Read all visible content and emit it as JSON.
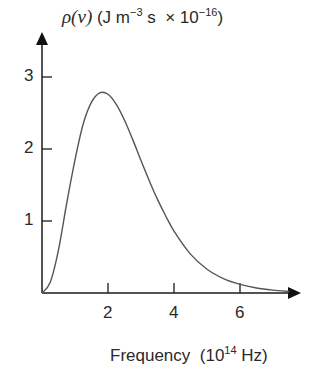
{
  "chart_data": {
    "type": "line",
    "title": "",
    "ylabel": {
      "symbol": "ρ(ν)",
      "units_prefix": "(J m",
      "units_exp": "−3",
      "units_mid": " s  × 10",
      "units_scale_exp": "−16",
      "units_suffix": ")"
    },
    "xlabel": {
      "text": "Frequency  (10",
      "exp": "14",
      "suffix": " Hz)"
    },
    "x_ticks": [
      "2",
      "4",
      "6"
    ],
    "y_ticks": [
      "1",
      "2",
      "3"
    ],
    "xlim": [
      0,
      7.7
    ],
    "ylim": [
      0,
      3.3
    ],
    "grid": false,
    "legend": null,
    "series": [
      {
        "name": "ρ(ν)",
        "x": [
          0,
          0.25,
          0.5,
          0.75,
          1.0,
          1.25,
          1.5,
          1.75,
          2.0,
          2.25,
          2.5,
          2.75,
          3.0,
          3.25,
          3.5,
          3.75,
          4.0,
          4.5,
          5.0,
          5.5,
          6.0,
          6.5,
          7.0,
          7.5
        ],
        "values": [
          0,
          0.15,
          0.6,
          1.25,
          1.85,
          2.35,
          2.65,
          2.78,
          2.76,
          2.62,
          2.4,
          2.13,
          1.84,
          1.56,
          1.3,
          1.07,
          0.86,
          0.54,
          0.33,
          0.2,
          0.12,
          0.07,
          0.04,
          0.02
        ]
      }
    ]
  },
  "colors": {
    "axis": "#1a1a1a",
    "curve": "#555555"
  }
}
